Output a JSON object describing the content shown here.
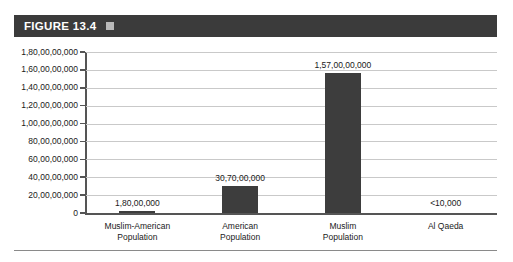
{
  "figure": {
    "header_label": "FIGURE 13.4",
    "header_icon": "square-icon",
    "header_color": "#3b3b3b",
    "bar_color": "#3d3d3d"
  },
  "chart_data": {
    "type": "bar",
    "title": "",
    "xlabel": "",
    "ylabel": "",
    "grid": true,
    "legend": "none",
    "ylim": [
      0,
      1800000000
    ],
    "categories": [
      "Muslim-American Population",
      "American Population",
      "Muslim Population",
      "Al Qaeda"
    ],
    "category_lines": [
      [
        "Muslim-American",
        "Population"
      ],
      [
        "American",
        "Population"
      ],
      [
        "Muslim",
        "Population"
      ],
      [
        "Al Qaeda"
      ]
    ],
    "values": [
      18000000,
      307000000,
      1570000000,
      10000
    ],
    "value_labels": [
      "1,80,00,000",
      "30,70,00,000",
      "1,57,00,00,000",
      "<10,000"
    ],
    "ytick_values": [
      1800000000,
      1600000000,
      1400000000,
      1200000000,
      1000000000,
      800000000,
      600000000,
      400000000,
      200000000,
      0
    ],
    "ytick_labels": [
      "1,80,00,00,000",
      "1,60,00,00,000",
      "1,40,00,00,000",
      "1,20,00,00,000",
      "1,00,00,00,000",
      "80,00,00,000",
      "60,00,00,000",
      "40,00,00,000",
      "20,00,00,000",
      "0"
    ]
  }
}
